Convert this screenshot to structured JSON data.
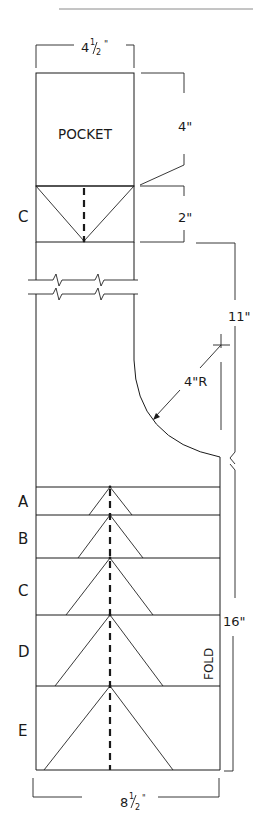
{
  "header": {
    "running_text": "",
    "rule_color": "#8a8a8a"
  },
  "dimensions": {
    "top_width": "4½\"",
    "top_width_whole": "4",
    "top_width_frac_num": "1",
    "top_width_frac_den": "2",
    "pocket_height": "4\"",
    "cuff_height": "2\"",
    "upper_length": "11\"",
    "radius": "4\"R",
    "lower_length": "16\"",
    "bottom_width_whole": "8",
    "bottom_width_frac_num": "1",
    "bottom_width_frac_den": "2"
  },
  "labels": {
    "pocket": "POCKET",
    "pocket_section": "C",
    "fold": "FOLD",
    "bands": [
      "A",
      "B",
      "C",
      "D",
      "E"
    ]
  },
  "colors": {
    "line": "#1a1a1a",
    "background": "#ffffff"
  }
}
